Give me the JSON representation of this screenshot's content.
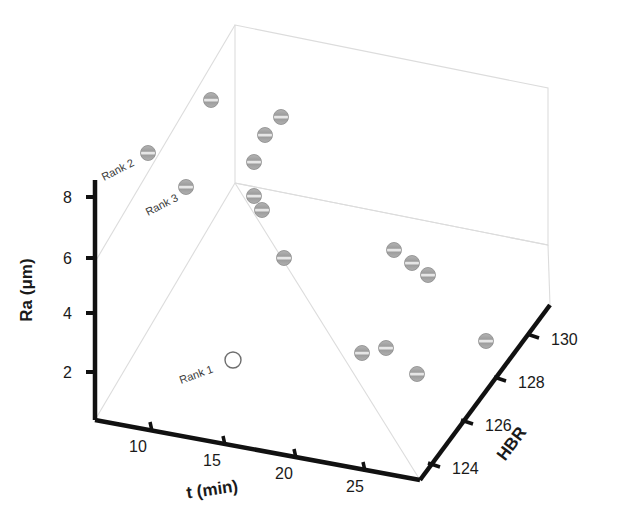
{
  "figure": {
    "type": "3d-scatter",
    "background": "#ffffff",
    "box_line_color": "#d8d8d8",
    "axis_line_color": "#111111",
    "marker_fill": "#a8a8a8",
    "marker_stroke": "#8a8a8a",
    "highlight_marker_fill": "#ffffff",
    "highlight_marker_stroke": "#6e6e6e"
  },
  "axes": {
    "y": {
      "title": "Ra (μm)",
      "ticks": [
        "2",
        "4",
        "6",
        "8"
      ],
      "values": [
        2,
        4,
        6,
        8
      ],
      "range": [
        0,
        9.5
      ]
    },
    "x": {
      "title": "t (min)",
      "ticks": [
        "10",
        "15",
        "20",
        "25"
      ],
      "values": [
        10,
        15,
        20,
        25
      ],
      "range": [
        7.5,
        28
      ]
    },
    "z": {
      "title": "HBR",
      "ticks": [
        "124",
        "126",
        "128",
        "130"
      ],
      "values": [
        124,
        126,
        128,
        130
      ],
      "range": [
        123,
        131
      ]
    }
  },
  "annotations": [
    {
      "text": "Rank 2",
      "x": 104,
      "y": 181,
      "rotate": -27
    },
    {
      "text": "Rank 3",
      "x": 148,
      "y": 216,
      "rotate": -27
    },
    {
      "text": "Rank 1",
      "x": 181,
      "y": 384,
      "rotate": -20
    }
  ],
  "chart_data": {
    "type": "scatter",
    "title": "",
    "xlabel": "t (min)",
    "ylabel": "Ra (μm)",
    "zlabel": "HBR",
    "xlim": [
      7.5,
      28
    ],
    "ylim": [
      0,
      9.5
    ],
    "zlim": [
      123,
      131
    ],
    "grid": false,
    "legend": false,
    "marker_style": "striped-sphere",
    "points": [
      {
        "px": 211,
        "py": 100,
        "marker": "filled"
      },
      {
        "px": 148,
        "py": 153,
        "marker": "filled"
      },
      {
        "px": 186,
        "py": 187,
        "marker": "filled"
      },
      {
        "px": 281,
        "py": 117,
        "marker": "filled"
      },
      {
        "px": 265,
        "py": 135,
        "marker": "filled"
      },
      {
        "px": 254,
        "py": 162,
        "marker": "filled"
      },
      {
        "px": 254,
        "py": 196,
        "marker": "filled"
      },
      {
        "px": 262,
        "py": 210,
        "marker": "filled"
      },
      {
        "px": 284,
        "py": 258,
        "marker": "filled"
      },
      {
        "px": 394,
        "py": 250,
        "marker": "filled"
      },
      {
        "px": 412,
        "py": 263,
        "marker": "filled"
      },
      {
        "px": 428,
        "py": 275,
        "marker": "filled"
      },
      {
        "px": 362,
        "py": 353,
        "marker": "filled"
      },
      {
        "px": 386,
        "py": 348,
        "marker": "filled"
      },
      {
        "px": 417,
        "py": 374,
        "marker": "filled"
      },
      {
        "px": 486,
        "py": 341,
        "marker": "filled"
      },
      {
        "px": 233,
        "py": 360,
        "marker": "hollow",
        "label": "Rank 1"
      }
    ]
  },
  "geometry": {
    "box": {
      "origin": [
        95,
        420
      ],
      "front_top": [
        95,
        262
      ],
      "back_bottom_left": [
        235,
        183
      ],
      "back_top_left": [
        235,
        25
      ],
      "back_bottom_right": [
        548,
        245
      ],
      "back_top_right": [
        548,
        88
      ],
      "front_bottom_right": [
        420,
        480
      ],
      "right_bottom": [
        550,
        305
      ]
    }
  }
}
